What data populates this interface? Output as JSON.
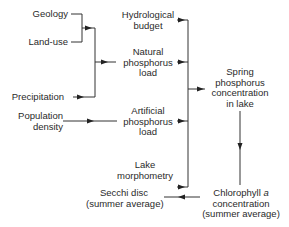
{
  "diagram": {
    "type": "flowchart",
    "nodes": {
      "geology": {
        "label": "Geology"
      },
      "land_use": {
        "label": "Land-use"
      },
      "precipitation": {
        "label": "Precipitation"
      },
      "population_density": {
        "line1": "Population",
        "line2": "density"
      },
      "hydrological_budget": {
        "line1": "Hydrological",
        "line2": "budget"
      },
      "natural_phosphorus_load": {
        "line1": "Natural",
        "line2": "phosphorus",
        "line3": "load"
      },
      "artificial_phosphorus_load": {
        "line1": "Artificial",
        "line2": "phosphorus",
        "line3": "load"
      },
      "lake_morphometry": {
        "line1": "Lake",
        "line2": "morphometry"
      },
      "spring_phosphorus": {
        "line1": "Spring",
        "line2": "phosphorus",
        "line3": "concentration",
        "line4": "in lake"
      },
      "chlorophyll": {
        "line1_prefix": "Chlorophyll ",
        "line1_italic": "a",
        "line2": "concentration",
        "line3": "(summer average)"
      },
      "secchi_disc": {
        "line1": "Secchi disc",
        "line2": "(summer average)"
      }
    },
    "edges": [
      {
        "from": "Geology",
        "to": "Natural phosphorus load"
      },
      {
        "from": "Land-use",
        "to": "Natural phosphorus load"
      },
      {
        "from": "Precipitation",
        "to": "Natural phosphorus load"
      },
      {
        "from": "Population density",
        "to": "Artificial phosphorus load"
      },
      {
        "from": "Hydrological budget",
        "to": "Spring phosphorus concentration in lake"
      },
      {
        "from": "Natural phosphorus load",
        "to": "Spring phosphorus concentration in lake"
      },
      {
        "from": "Artificial phosphorus load",
        "to": "Spring phosphorus concentration in lake"
      },
      {
        "from": "Lake morphometry",
        "to": "Spring phosphorus concentration in lake"
      },
      {
        "from": "Spring phosphorus concentration in lake",
        "to": "Chlorophyll a concentration (summer average)"
      },
      {
        "from": "Chlorophyll a concentration (summer average)",
        "to": "Secchi disc (summer average)"
      }
    ],
    "colors": {
      "line": "#333333",
      "text": "#2a2a2a",
      "background": "#ffffff"
    }
  }
}
